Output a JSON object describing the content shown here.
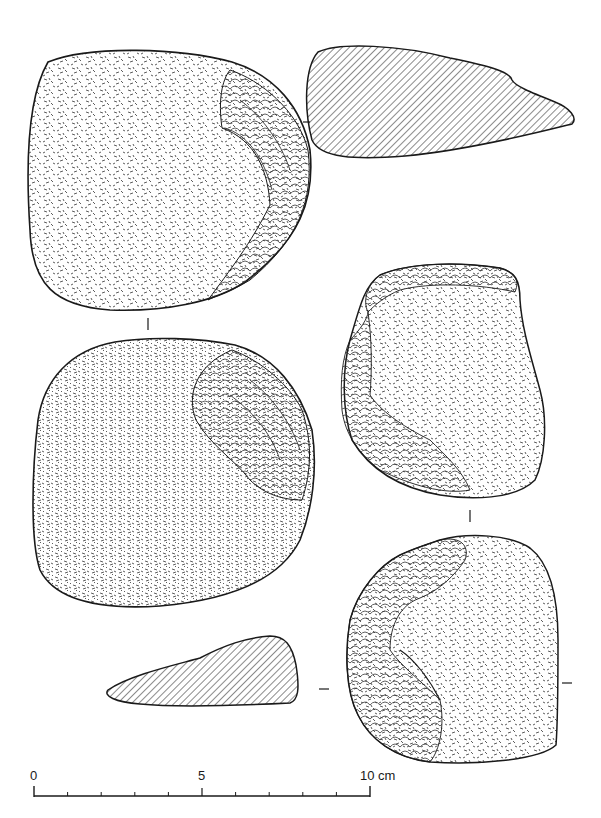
{
  "figure": {
    "type": "archaeological lithic illustration",
    "colors": {
      "ink": "#1a1a1a",
      "background": "#ffffff",
      "hatch": "#2a2a2a"
    },
    "artifacts": [
      {
        "id": "A",
        "view": "dorsal",
        "position": "top-left",
        "description": "Pebble tool, cortex surface with flake scars on right edge"
      },
      {
        "id": "A-section",
        "view": "cross-section",
        "position": "top-right",
        "description": "Hatched section, elongated wedge"
      },
      {
        "id": "B",
        "view": "ventral",
        "position": "middle-left",
        "description": "Pebble tool, cortex with large flake scars upper right"
      },
      {
        "id": "B-section",
        "view": "cross-section",
        "position": "bottom-left",
        "description": "Hatched section, trapezoid wedge"
      },
      {
        "id": "C",
        "view": "face",
        "position": "middle-right",
        "description": "Chopper with retouched margins"
      },
      {
        "id": "D",
        "view": "face",
        "position": "bottom-right",
        "description": "Flaked tool with cortex remnant"
      }
    ]
  },
  "scale_bar": {
    "labels": [
      "0",
      "5",
      "10 cm"
    ],
    "min": 0,
    "max": 10,
    "unit": "cm",
    "ticks": 10
  }
}
